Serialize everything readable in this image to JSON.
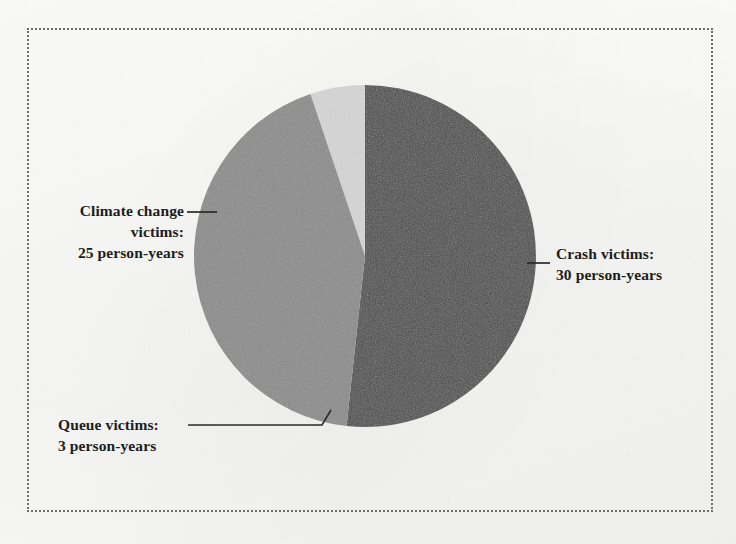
{
  "figure": {
    "background_color": "#f8f8f6",
    "border_style": "dotted",
    "border_color": "#6d6d6d"
  },
  "chart_data": {
    "type": "pie",
    "title": "",
    "unit": "person-years",
    "total": 58,
    "start_angle_deg": 90,
    "direction": "clockwise",
    "center": {
      "x": 365,
      "y": 256
    },
    "radius": 171,
    "categories": [
      "Crash victims",
      "Climate change victims",
      "Queue victims"
    ],
    "values": [
      30,
      25,
      3
    ],
    "colors": [
      "#484848",
      "#8a8a8a",
      "#d5d5d5"
    ],
    "slices": [
      {
        "name": "Crash victims",
        "value": 30,
        "unit_label": "30 person-years",
        "percent": 51.7,
        "angle_deg": 186.2,
        "color": "#484848",
        "label_position": "right"
      },
      {
        "name": "Climate change victims",
        "value": 25,
        "unit_label": "25 person-years",
        "percent": 43.1,
        "angle_deg": 155.2,
        "color": "#8a8a8a",
        "label_position": "left"
      },
      {
        "name": "Queue victims",
        "value": 3,
        "unit_label": "3 person-years",
        "percent": 5.2,
        "angle_deg": 18.6,
        "color": "#d5d5d5",
        "label_position": "bottom-left"
      }
    ],
    "legend": "callout-labels",
    "grid": false
  },
  "labels": {
    "climate": {
      "line1": "Climate change",
      "line2": "victims:",
      "line3": "25 person-years"
    },
    "crash": {
      "line1": "Crash victims:",
      "line2": "30 person-years"
    },
    "queue": {
      "line1": "Queue victims:",
      "line2": "3 person-years"
    }
  }
}
